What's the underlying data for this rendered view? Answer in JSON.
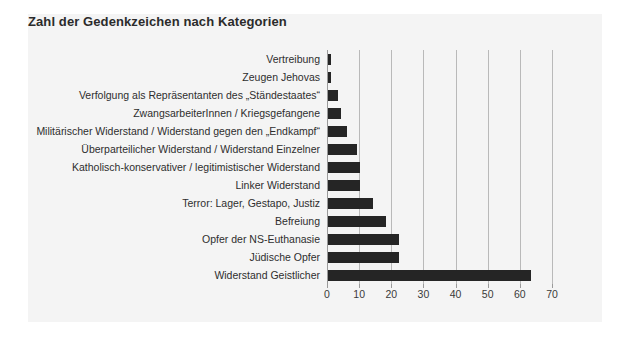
{
  "card": {
    "title": "Zahl der Gedenkzeichen nach Kategorien",
    "background_color": "#f4f4f4",
    "title_color": "#2b2b2b"
  },
  "chart_data": {
    "type": "bar",
    "orientation": "horizontal",
    "title": "Zahl der Gedenkzeichen nach Kategorien",
    "xlabel": "",
    "ylabel": "",
    "xlim": [
      0,
      70
    ],
    "xticks": [
      0,
      10,
      20,
      30,
      40,
      50,
      60,
      70
    ],
    "grid": "vertical",
    "legend": "none",
    "bar_color": "#252525",
    "grid_color": "#b9b9b9",
    "categories": [
      "Vertreibung",
      "Zeugen Jehovas",
      "Verfolgung als Repräsentanten des „Ständestaates“",
      "ZwangsarbeiterInnen / Kriegsgefangene",
      "Militärischer Widerstand / Widerstand gegen den „Endkampf“",
      "Überparteilicher Widerstand / Widerstand Einzelner",
      "Katholisch-konservativer / legitimistischer Widerstand",
      "Linker Widerstand",
      "Terror: Lager, Gestapo, Justiz",
      "Befreiung",
      "Opfer der NS-Euthanasie",
      "Jüdische Opfer",
      "Widerstand Geistlicher"
    ],
    "values": [
      1,
      1,
      3,
      4,
      6,
      9,
      10,
      10,
      14,
      18,
      22,
      22,
      63
    ]
  }
}
